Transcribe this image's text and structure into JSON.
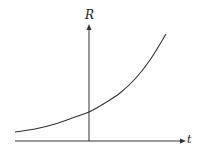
{
  "chart_data": {
    "type": "line",
    "title": "",
    "xlabel": "t",
    "ylabel": "R",
    "grid": false,
    "legend": null,
    "ticks": {
      "x": [],
      "y": []
    },
    "series": [
      {
        "name": "R(t)",
        "shape": "exponential increasing",
        "points_px": [
          [
            15,
            132
          ],
          [
            35,
            129
          ],
          [
            55,
            124
          ],
          [
            75,
            117
          ],
          [
            89,
            112
          ],
          [
            105,
            103
          ],
          [
            120,
            93
          ],
          [
            135,
            79
          ],
          [
            150,
            60
          ],
          [
            166,
            34
          ]
        ],
        "value_at_t0_relative": 0.25
      }
    ],
    "colors": {
      "axes": "#333333",
      "curve": "#333333",
      "background": "#ffffff"
    }
  },
  "labels": {
    "x_axis": "t",
    "y_axis": "R"
  }
}
